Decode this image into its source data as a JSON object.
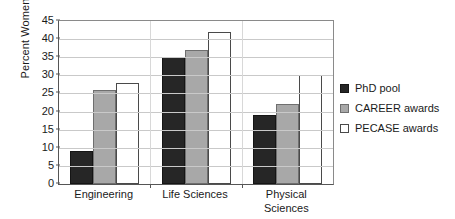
{
  "chart_data": {
    "type": "bar",
    "title": "",
    "xlabel": "",
    "ylabel": "Percent Women",
    "ylim": [
      0,
      45
    ],
    "ytick_step": 5,
    "yticks": [
      0,
      5,
      10,
      15,
      20,
      25,
      30,
      35,
      40,
      45
    ],
    "ytick_labels": [
      "0",
      "5",
      "10",
      "15",
      "20",
      "25",
      "30",
      "35",
      "40",
      "45"
    ],
    "grid": true,
    "legend_position": "right",
    "categories": [
      "Engineering",
      "Life Sciences",
      "Physical Sciences"
    ],
    "category_label_lines": [
      [
        "Engineering"
      ],
      [
        "Life Sciences"
      ],
      [
        "Physical",
        "Sciences"
      ]
    ],
    "series": [
      {
        "name": "PhD pool",
        "color": "#262626",
        "values": [
          9,
          35,
          19
        ]
      },
      {
        "name": "CAREER awards",
        "color": "#a8a8a8",
        "values": [
          26,
          37,
          22
        ]
      },
      {
        "name": "PECASE awards",
        "color": "#ffffff",
        "values": [
          28,
          42,
          30
        ]
      }
    ]
  },
  "legend": {
    "items": [
      {
        "label": "PhD pool"
      },
      {
        "label": "CAREER awards"
      },
      {
        "label": "PECASE awards"
      }
    ]
  }
}
